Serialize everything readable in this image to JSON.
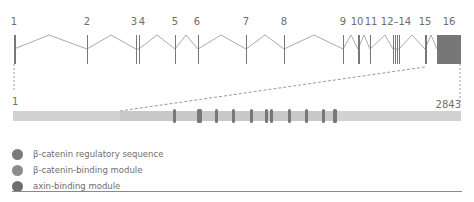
{
  "gene": {
    "exons": [
      {
        "label": "1"
      },
      {
        "label": "2"
      },
      {
        "label": "3"
      },
      {
        "label": "4"
      },
      {
        "label": "5"
      },
      {
        "label": "6"
      },
      {
        "label": "7"
      },
      {
        "label": "8"
      },
      {
        "label": "9"
      },
      {
        "label": "10"
      },
      {
        "label": "11"
      },
      {
        "label": "12–14"
      },
      {
        "label": "15"
      },
      {
        "label": "16"
      }
    ]
  },
  "protein": {
    "start_label": "1",
    "end_label": "2843",
    "length": 2843
  },
  "legend": [
    {
      "label": "β-catenin regulatory sequence",
      "color": "#7a7a7a"
    },
    {
      "label": "β-catenin-binding module",
      "color": "#8c8c8c"
    },
    {
      "label": "axin-binding module",
      "color": "#6f6f6f"
    }
  ],
  "colors": {
    "exon": "#777777",
    "intron": "#aaaaaa",
    "protein_light": "#d2d2d2",
    "protein_mid": "#c4c4c4",
    "domain": "#777777",
    "dashed": "#9a9a9a"
  }
}
